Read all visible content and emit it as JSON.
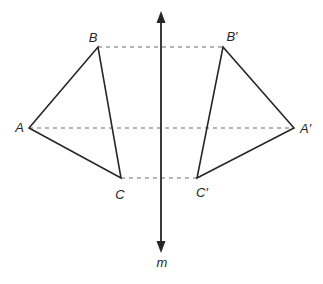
{
  "figure": {
    "width": 323,
    "height": 284,
    "background": "#ffffff",
    "colors": {
      "solid_line": "#262626",
      "dashed_line": "#9e9e9e",
      "label_text": "#262626"
    },
    "mirror_line": {
      "x": 161,
      "top_tip_y": 11,
      "bottom_tip_y": 253,
      "stroke_width": 1.8,
      "arrow_half_width": 4.5,
      "arrow_length": 12,
      "label": "m",
      "label_x": 162,
      "label_y": 267
    },
    "triangles": [
      {
        "name": "ABC",
        "points": "29,128 98,47 121,178",
        "stroke_width": 1.6
      },
      {
        "name": "A-prime-B-prime-C-prime",
        "points": "294,128 223,47 197,178",
        "stroke_width": 1.6
      }
    ],
    "dashed_segments": [
      {
        "name": "BB-prime",
        "x1": 98,
        "y1": 47,
        "x2": 223,
        "y2": 47
      },
      {
        "name": "AA-prime",
        "x1": 29,
        "y1": 128,
        "x2": 294,
        "y2": 128
      },
      {
        "name": "CC-prime",
        "x1": 121,
        "y1": 178,
        "x2": 197,
        "y2": 178
      }
    ],
    "dash_pattern": "4 4",
    "dashed_stroke_width": 1.4,
    "vertex_labels": [
      {
        "name": "A",
        "text": "A",
        "x": 24,
        "y": 132,
        "anchor": "end"
      },
      {
        "name": "B",
        "text": "B",
        "x": 93,
        "y": 42,
        "anchor": "middle"
      },
      {
        "name": "C",
        "text": "C",
        "x": 120,
        "y": 199,
        "anchor": "middle"
      },
      {
        "name": "B-prime",
        "text": "B′",
        "x": 232,
        "y": 41,
        "anchor": "middle"
      },
      {
        "name": "A-prime",
        "text": "A′",
        "x": 300,
        "y": 133,
        "anchor": "start"
      },
      {
        "name": "C-prime",
        "text": "C′",
        "x": 202,
        "y": 197,
        "anchor": "middle"
      }
    ]
  }
}
